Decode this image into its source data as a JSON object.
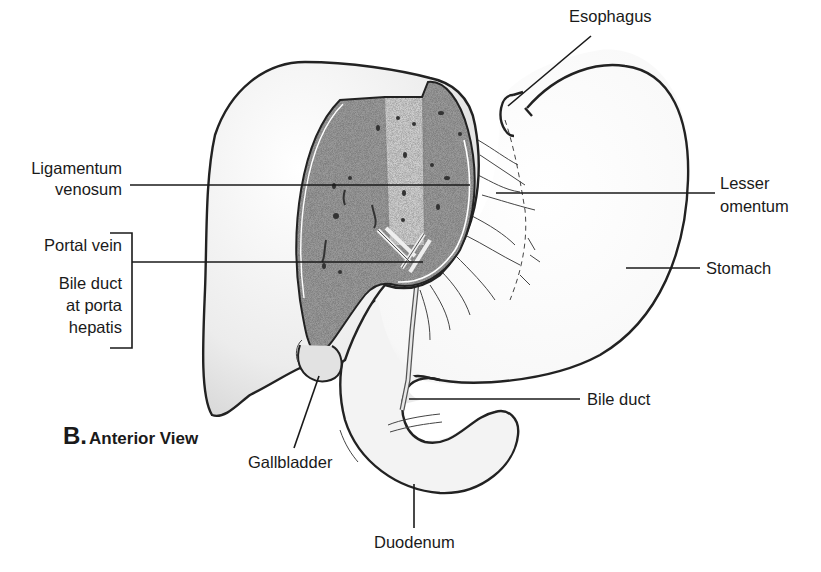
{
  "figure": {
    "title_letter": "B.",
    "title_text": "Anterior View",
    "colors": {
      "background": "#ffffff",
      "outline": "#222222",
      "liver_fill": "#ececec",
      "cut_surface": "#8a8a8a",
      "fissure_band": "#c8c8c8",
      "text": "#1a1a1a"
    }
  },
  "labels": {
    "esophagus": "Esophagus",
    "ligamentum_venosum_1": "Ligamentum",
    "ligamentum_venosum_2": "venosum",
    "lesser_omentum_1": "Lesser",
    "lesser_omentum_2": "omentum",
    "portal_vein": "Portal vein",
    "bile_duct_porta_1": "Bile duct",
    "bile_duct_porta_2": "at porta",
    "bile_duct_porta_3": "hepatis",
    "stomach": "Stomach",
    "bile_duct": "Bile duct",
    "gallbladder": "Gallbladder",
    "duodenum": "Duodenum"
  },
  "structures": [
    "liver",
    "cut-surface-of-liver",
    "stomach",
    "esophagus",
    "lesser-omentum",
    "gallbladder",
    "duodenum",
    "bile-duct"
  ]
}
